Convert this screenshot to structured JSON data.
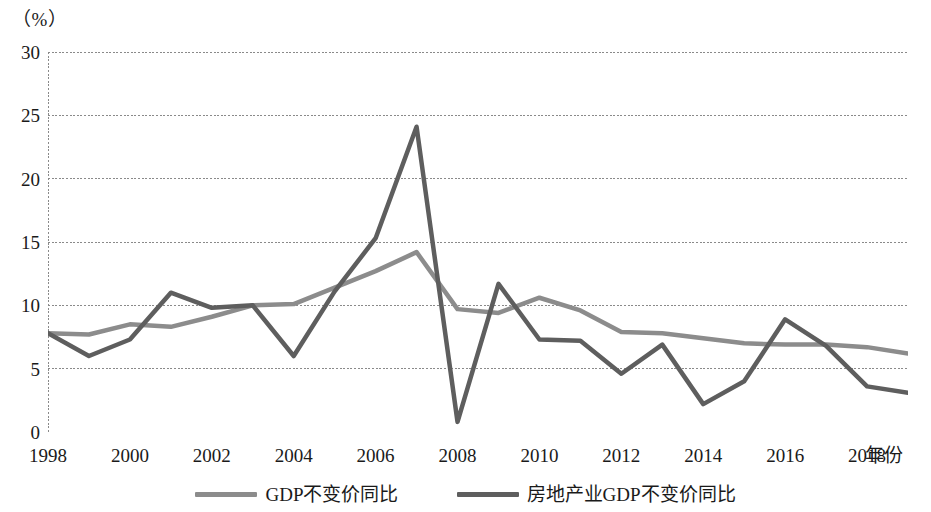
{
  "chart_data": {
    "type": "line",
    "title": "",
    "unit_label": "（%）",
    "xlabel": "年份",
    "ylabel": "",
    "grid": true,
    "legend_position": "bottom",
    "ylim": [
      0,
      30
    ],
    "yticks": [
      0,
      5,
      10,
      15,
      20,
      25,
      30
    ],
    "xlim": [
      1998,
      2019
    ],
    "xticks": [
      1998,
      2000,
      2002,
      2004,
      2006,
      2008,
      2010,
      2012,
      2014,
      2016,
      2018
    ],
    "x": [
      1998,
      1999,
      2000,
      2001,
      2002,
      2003,
      2004,
      2005,
      2006,
      2007,
      2008,
      2009,
      2010,
      2011,
      2012,
      2013,
      2014,
      2015,
      2016,
      2017,
      2018,
      2019
    ],
    "series": [
      {
        "name": "GDP不变价同比",
        "color": "#8c8c8c",
        "values": [
          7.8,
          7.7,
          8.5,
          8.3,
          9.1,
          10.0,
          10.1,
          11.4,
          12.7,
          14.2,
          9.7,
          9.4,
          10.6,
          9.6,
          7.9,
          7.8,
          7.4,
          7.0,
          6.9,
          6.9,
          6.7,
          6.2
        ]
      },
      {
        "name": "房地产业GDP不变价同比",
        "color": "#5e5e5e",
        "values": [
          7.8,
          6.0,
          7.3,
          11.0,
          9.8,
          10.0,
          6.0,
          11.1,
          15.3,
          24.1,
          0.8,
          11.7,
          7.3,
          7.2,
          4.6,
          6.9,
          2.2,
          4.0,
          8.9,
          6.8,
          3.6,
          3.1
        ]
      }
    ]
  },
  "axis": {
    "y_tick_labels": [
      "30",
      "25",
      "20",
      "15",
      "10",
      "5",
      "0"
    ],
    "x_tick_labels": [
      "1998",
      "2000",
      "2002",
      "2004",
      "2006",
      "2008",
      "2010",
      "2012",
      "2014",
      "2016",
      "2018"
    ],
    "x_title": "年份",
    "unit": "（%）"
  },
  "legend": {
    "items": [
      {
        "label": "GDP不变价同比",
        "color": "#8c8c8c"
      },
      {
        "label": "房地产业GDP不变价同比",
        "color": "#5e5e5e"
      }
    ]
  }
}
